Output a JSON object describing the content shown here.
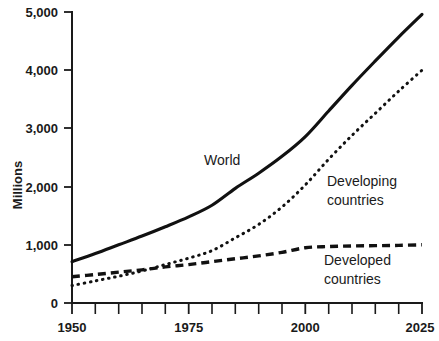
{
  "chart_data": {
    "type": "line",
    "title": "",
    "xlabel": "",
    "ylabel": "Millions",
    "xlim": [
      1950,
      2025
    ],
    "ylim": [
      0,
      5000
    ],
    "grid": false,
    "legend_position": "inline-annotations",
    "x_tick_labels": [
      "1950",
      "1975",
      "2000",
      "2025"
    ],
    "x_tick_values": [
      1950,
      1975,
      2000,
      2025
    ],
    "x_minor_ticks": [
      1955,
      1960,
      1965,
      1970,
      1980,
      1985,
      1990,
      1995,
      2005,
      2010,
      2015,
      2020
    ],
    "y_tick_labels": [
      "0",
      "1,000",
      "2,000",
      "3,000",
      "4,000",
      "5,000"
    ],
    "y_tick_values": [
      0,
      1000,
      2000,
      3000,
      4000,
      5000
    ],
    "x": [
      1950,
      1955,
      1960,
      1965,
      1970,
      1975,
      1980,
      1985,
      1990,
      1995,
      2000,
      2005,
      2010,
      2015,
      2020,
      2025
    ],
    "series": [
      {
        "name": "World",
        "style": "solid",
        "label": "World",
        "values": [
          710,
          850,
          1000,
          1150,
          1310,
          1480,
          1680,
          1970,
          2230,
          2520,
          2860,
          3300,
          3740,
          4160,
          4570,
          4960
        ]
      },
      {
        "name": "Developing countries",
        "style": "dotted",
        "label": "Developing countries",
        "values": [
          300,
          380,
          460,
          550,
          660,
          770,
          900,
          1120,
          1350,
          1650,
          2030,
          2470,
          2880,
          3260,
          3640,
          4000
        ]
      },
      {
        "name": "Developed countries",
        "style": "dashed",
        "label": "Developed countries",
        "values": [
          450,
          490,
          530,
          570,
          620,
          660,
          710,
          760,
          810,
          870,
          950,
          970,
          980,
          985,
          990,
          1000
        ]
      }
    ],
    "annotations": [
      {
        "text": "World",
        "x": 1985,
        "y": 2350
      },
      {
        "text": "Developing",
        "x": 2003,
        "y": 1780
      },
      {
        "text": "countries",
        "x": 2003,
        "y": 1520
      },
      {
        "text": "Developed",
        "x": 2003,
        "y": 700
      },
      {
        "text": "countries",
        "x": 2003,
        "y": 440
      }
    ]
  },
  "labels": {
    "y_axis_title": "Millions",
    "world": "World",
    "developing_line1": "Developing",
    "developing_line2": "countries",
    "developed_line1": "Developed",
    "developed_line2": "countries",
    "y0": "0",
    "y1000": "1,000",
    "y2000": "2,000",
    "y3000": "3,000",
    "y4000": "4,000",
    "y5000": "5,000",
    "x1950": "1950",
    "x1975": "1975",
    "x2000": "2000",
    "x2025": "2025"
  },
  "colors": {
    "ink": "#1a1a1a",
    "line": "#111111",
    "background": "#ffffff"
  }
}
